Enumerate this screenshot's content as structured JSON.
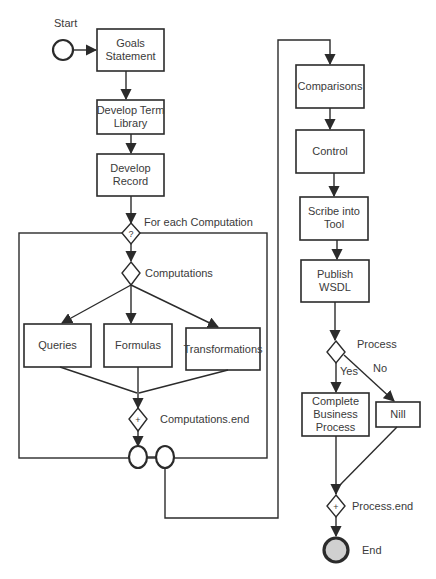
{
  "diagram": {
    "events": {
      "start": "Start",
      "end": "End"
    },
    "tasks": {
      "goals": [
        "Goals",
        "Statement"
      ],
      "term_library": [
        "Develop Term",
        "Library"
      ],
      "record": [
        "Develop",
        "Record"
      ],
      "queries": "Queries",
      "formulas": "Formulas",
      "transformations": "Transformations",
      "comparisons": "Comparisons",
      "control": "Control",
      "scribe": [
        "Scribe into",
        "Tool"
      ],
      "publish": [
        "Publish",
        "WSDL"
      ],
      "complete": [
        "Complete",
        "Business",
        "Process"
      ],
      "nill": "Nill"
    },
    "gateways": {
      "loop_symbol": "?",
      "loop_label": "For each Computation",
      "computations_label": "Computations",
      "computations_end_symbol": "+",
      "computations_end_label": "Computations.end",
      "process_label": "Process",
      "process_end_symbol": "+",
      "process_end_label": "Process.end"
    },
    "edge_labels": {
      "yes": "Yes",
      "no": "No"
    }
  }
}
